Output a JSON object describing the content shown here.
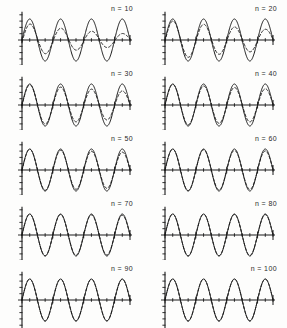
{
  "figure": {
    "name": "convergence-of-fourier-approximation-panels",
    "background_color": "#fdfdfc",
    "ink_color": "#1a1a1a",
    "columns": 2,
    "rows": 5
  },
  "chart_data": [
    {
      "type": "line",
      "panel_label": "n = 10",
      "n": 10,
      "title": "",
      "subtitle": "",
      "xlabel": "",
      "ylabel": "",
      "xlim": [
        0,
        3.5
      ],
      "ylim": [
        -1.35,
        1.35
      ],
      "grid": false,
      "legend_position": "none",
      "x_unit": "periods",
      "x_ticks": [
        0,
        0.25,
        0.5,
        0.75,
        1,
        1.25,
        1.5,
        1.75,
        2,
        2.25,
        2.5,
        2.75,
        3,
        3.25,
        3.5
      ],
      "y_ticks": [
        -1.2,
        -0.9,
        -0.6,
        -0.3,
        0,
        0.3,
        0.6,
        0.9,
        1.2
      ],
      "series": [
        {
          "name": "exact",
          "style": "solid",
          "color": "#1a1a1a",
          "amplitude": 1.0,
          "decay_per_period": 0.0,
          "phase": 0.0
        },
        {
          "name": "approximation",
          "style": "dashed",
          "color": "#1a1a1a",
          "amplitude": 0.82,
          "decay_per_period": 0.3,
          "phase": -0.12
        }
      ]
    },
    {
      "type": "line",
      "panel_label": "n = 20",
      "n": 20,
      "title": "",
      "subtitle": "",
      "xlabel": "",
      "ylabel": "",
      "xlim": [
        0,
        3.5
      ],
      "ylim": [
        -1.35,
        1.35
      ],
      "grid": false,
      "legend_position": "none",
      "x_unit": "periods",
      "x_ticks": [
        0,
        0.25,
        0.5,
        0.75,
        1,
        1.25,
        1.5,
        1.75,
        2,
        2.25,
        2.5,
        2.75,
        3,
        3.25,
        3.5
      ],
      "y_ticks": [
        -1.2,
        -0.9,
        -0.6,
        -0.3,
        0,
        0.3,
        0.6,
        0.9,
        1.2
      ],
      "series": [
        {
          "name": "exact",
          "style": "solid",
          "color": "#1a1a1a",
          "amplitude": 1.0,
          "decay_per_period": 0.0,
          "phase": 0.0
        },
        {
          "name": "approximation",
          "style": "dashed",
          "color": "#1a1a1a",
          "amplitude": 0.95,
          "decay_per_period": 0.19,
          "phase": -0.07
        }
      ]
    },
    {
      "type": "line",
      "panel_label": "n = 30",
      "n": 30,
      "title": "",
      "subtitle": "",
      "xlabel": "",
      "ylabel": "",
      "xlim": [
        0,
        3.5
      ],
      "ylim": [
        -1.35,
        1.35
      ],
      "grid": false,
      "legend_position": "none",
      "x_unit": "periods",
      "x_ticks": [
        0,
        0.25,
        0.5,
        0.75,
        1,
        1.25,
        1.5,
        1.75,
        2,
        2.25,
        2.5,
        2.75,
        3,
        3.25,
        3.5
      ],
      "y_ticks": [
        -1.2,
        -0.9,
        -0.6,
        -0.3,
        0,
        0.3,
        0.6,
        0.9,
        1.2
      ],
      "series": [
        {
          "name": "exact",
          "style": "solid",
          "color": "#1a1a1a",
          "amplitude": 1.0,
          "decay_per_period": 0.0,
          "phase": 0.0
        },
        {
          "name": "approximation",
          "style": "dashed",
          "color": "#1a1a1a",
          "amplitude": 0.99,
          "decay_per_period": 0.12,
          "phase": -0.04
        }
      ]
    },
    {
      "type": "line",
      "panel_label": "n = 40",
      "n": 40,
      "title": "",
      "subtitle": "",
      "xlabel": "",
      "ylabel": "",
      "xlim": [
        0,
        3.5
      ],
      "ylim": [
        -1.35,
        1.35
      ],
      "grid": false,
      "legend_position": "none",
      "x_unit": "periods",
      "x_ticks": [
        0,
        0.25,
        0.5,
        0.75,
        1,
        1.25,
        1.5,
        1.75,
        2,
        2.25,
        2.5,
        2.75,
        3,
        3.25,
        3.5
      ],
      "y_ticks": [
        -1.2,
        -0.9,
        -0.6,
        -0.3,
        0,
        0.3,
        0.6,
        0.9,
        1.2
      ],
      "series": [
        {
          "name": "exact",
          "style": "solid",
          "color": "#1a1a1a",
          "amplitude": 1.0,
          "decay_per_period": 0.0,
          "phase": 0.0
        },
        {
          "name": "approximation",
          "style": "dashed",
          "color": "#1a1a1a",
          "amplitude": 1.0,
          "decay_per_period": 0.08,
          "phase": -0.03
        }
      ]
    },
    {
      "type": "line",
      "panel_label": "n = 50",
      "n": 50,
      "title": "",
      "subtitle": "",
      "xlabel": "",
      "ylabel": "",
      "xlim": [
        0,
        3.5
      ],
      "ylim": [
        -1.35,
        1.35
      ],
      "grid": false,
      "legend_position": "none",
      "x_unit": "periods",
      "x_ticks": [
        0,
        0.25,
        0.5,
        0.75,
        1,
        1.25,
        1.5,
        1.75,
        2,
        2.25,
        2.5,
        2.75,
        3,
        3.25,
        3.5
      ],
      "y_ticks": [
        -1.2,
        -0.9,
        -0.6,
        -0.3,
        0,
        0.3,
        0.6,
        0.9,
        1.2
      ],
      "series": [
        {
          "name": "exact",
          "style": "solid",
          "color": "#1a1a1a",
          "amplitude": 1.0,
          "decay_per_period": 0.0,
          "phase": 0.0
        },
        {
          "name": "approximation",
          "style": "dashed",
          "color": "#1a1a1a",
          "amplitude": 1.0,
          "decay_per_period": 0.05,
          "phase": -0.02
        }
      ]
    },
    {
      "type": "line",
      "panel_label": "n = 60",
      "n": 60,
      "title": "",
      "subtitle": "",
      "xlabel": "",
      "ylabel": "",
      "xlim": [
        0,
        3.5
      ],
      "ylim": [
        -1.35,
        1.35
      ],
      "grid": false,
      "legend_position": "none",
      "x_unit": "periods",
      "x_ticks": [
        0,
        0.25,
        0.5,
        0.75,
        1,
        1.25,
        1.5,
        1.75,
        2,
        2.25,
        2.5,
        2.75,
        3,
        3.25,
        3.5
      ],
      "y_ticks": [
        -1.2,
        -0.9,
        -0.6,
        -0.3,
        0,
        0.3,
        0.6,
        0.9,
        1.2
      ],
      "series": [
        {
          "name": "exact",
          "style": "solid",
          "color": "#1a1a1a",
          "amplitude": 1.0,
          "decay_per_period": 0.0,
          "phase": 0.0
        },
        {
          "name": "approximation",
          "style": "dashed",
          "color": "#1a1a1a",
          "amplitude": 1.0,
          "decay_per_period": 0.03,
          "phase": -0.01
        }
      ]
    },
    {
      "type": "line",
      "panel_label": "n = 70",
      "n": 70,
      "title": "",
      "subtitle": "",
      "xlabel": "",
      "ylabel": "",
      "xlim": [
        0,
        3.5
      ],
      "ylim": [
        -1.35,
        1.35
      ],
      "grid": false,
      "legend_position": "none",
      "x_unit": "periods",
      "x_ticks": [
        0,
        0.25,
        0.5,
        0.75,
        1,
        1.25,
        1.5,
        1.75,
        2,
        2.25,
        2.5,
        2.75,
        3,
        3.25,
        3.5
      ],
      "y_ticks": [
        -1.2,
        -0.9,
        -0.6,
        -0.3,
        0,
        0.3,
        0.6,
        0.9,
        1.2
      ],
      "series": [
        {
          "name": "exact",
          "style": "solid",
          "color": "#1a1a1a",
          "amplitude": 1.0,
          "decay_per_period": 0.0,
          "phase": 0.0
        },
        {
          "name": "approximation",
          "style": "dashed",
          "color": "#1a1a1a",
          "amplitude": 1.0,
          "decay_per_period": 0.02,
          "phase": 0.0
        }
      ]
    },
    {
      "type": "line",
      "panel_label": "n = 80",
      "n": 80,
      "title": "",
      "subtitle": "",
      "xlabel": "",
      "ylabel": "",
      "xlim": [
        0,
        3.5
      ],
      "ylim": [
        -1.35,
        1.35
      ],
      "grid": false,
      "legend_position": "none",
      "x_unit": "periods",
      "x_ticks": [
        0,
        0.25,
        0.5,
        0.75,
        1,
        1.25,
        1.5,
        1.75,
        2,
        2.25,
        2.5,
        2.75,
        3,
        3.25,
        3.5
      ],
      "y_ticks": [
        -1.2,
        -0.9,
        -0.6,
        -0.3,
        0,
        0.3,
        0.6,
        0.9,
        1.2
      ],
      "series": [
        {
          "name": "exact",
          "style": "solid",
          "color": "#1a1a1a",
          "amplitude": 1.0,
          "decay_per_period": 0.0,
          "phase": 0.0
        },
        {
          "name": "approximation",
          "style": "dashed",
          "color": "#1a1a1a",
          "amplitude": 1.0,
          "decay_per_period": 0.01,
          "phase": 0.0
        }
      ]
    },
    {
      "type": "line",
      "panel_label": "n = 90",
      "n": 90,
      "title": "",
      "subtitle": "",
      "xlabel": "",
      "ylabel": "",
      "xlim": [
        0,
        3.5
      ],
      "ylim": [
        -1.35,
        1.35
      ],
      "grid": false,
      "legend_position": "none",
      "x_unit": "periods",
      "x_ticks": [
        0,
        0.25,
        0.5,
        0.75,
        1,
        1.25,
        1.5,
        1.75,
        2,
        2.25,
        2.5,
        2.75,
        3,
        3.25,
        3.5
      ],
      "y_ticks": [
        -1.2,
        -0.9,
        -0.6,
        -0.3,
        0,
        0.3,
        0.6,
        0.9,
        1.2
      ],
      "series": [
        {
          "name": "exact",
          "style": "solid",
          "color": "#1a1a1a",
          "amplitude": 1.0,
          "decay_per_period": 0.0,
          "phase": 0.0
        },
        {
          "name": "approximation",
          "style": "dashed",
          "color": "#1a1a1a",
          "amplitude": 1.0,
          "decay_per_period": 0.005,
          "phase": 0.0
        }
      ]
    },
    {
      "type": "line",
      "panel_label": "n = 100",
      "n": 100,
      "title": "",
      "subtitle": "",
      "xlabel": "",
      "ylabel": "",
      "xlim": [
        0,
        3.5
      ],
      "ylim": [
        -1.35,
        1.35
      ],
      "grid": false,
      "legend_position": "none",
      "x_unit": "periods",
      "x_ticks": [
        0,
        0.25,
        0.5,
        0.75,
        1,
        1.25,
        1.5,
        1.75,
        2,
        2.25,
        2.5,
        2.75,
        3,
        3.25,
        3.5
      ],
      "y_ticks": [
        -1.2,
        -0.9,
        -0.6,
        -0.3,
        0,
        0.3,
        0.6,
        0.9,
        1.2
      ],
      "series": [
        {
          "name": "exact",
          "style": "solid",
          "color": "#1a1a1a",
          "amplitude": 1.0,
          "decay_per_period": 0.0,
          "phase": 0.0
        },
        {
          "name": "approximation",
          "style": "dashed",
          "color": "#1a1a1a",
          "amplitude": 1.0,
          "decay_per_period": 0.002,
          "phase": 0.0
        }
      ]
    }
  ]
}
